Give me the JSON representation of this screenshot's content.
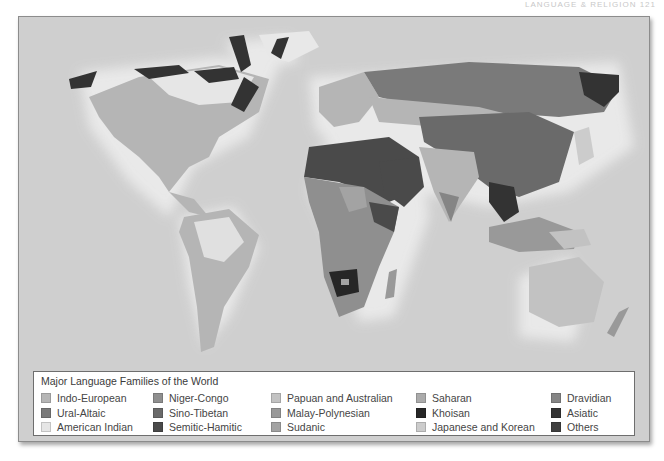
{
  "page_header": {
    "text": "LANGUAGE & RELIGION   121"
  },
  "map": {
    "ocean_color": "#cfcfcf",
    "glow_color": "#ececec"
  },
  "legend": {
    "title": "Major Language Families of the World",
    "columns": [
      [
        {
          "label": "Indo-European",
          "color": "#b5b5b5"
        },
        {
          "label": "Ural-Altaic",
          "color": "#7a7a7a"
        },
        {
          "label": "American Indian",
          "color": "#e6e6e6"
        }
      ],
      [
        {
          "label": "Niger-Congo",
          "color": "#8f8f8f"
        },
        {
          "label": "Sino-Tibetan",
          "color": "#6a6a6a"
        },
        {
          "label": "Semitic-Hamitic",
          "color": "#4a4a4a"
        }
      ],
      [
        {
          "label": "Papuan and Australian",
          "color": "#c2c2c2"
        },
        {
          "label": "Malay-Polynesian",
          "color": "#999999"
        },
        {
          "label": "Sudanic",
          "color": "#a3a3a3"
        }
      ],
      [
        {
          "label": "Saharan",
          "color": "#ababab"
        },
        {
          "label": "Khoisan",
          "color": "#262626"
        },
        {
          "label": "Japanese and Korean",
          "color": "#cccccc"
        }
      ],
      [
        {
          "label": "Dravidian",
          "color": "#858585"
        },
        {
          "label": "Asiatic",
          "color": "#333333"
        },
        {
          "label": "Others",
          "color": "#404040"
        }
      ]
    ]
  }
}
